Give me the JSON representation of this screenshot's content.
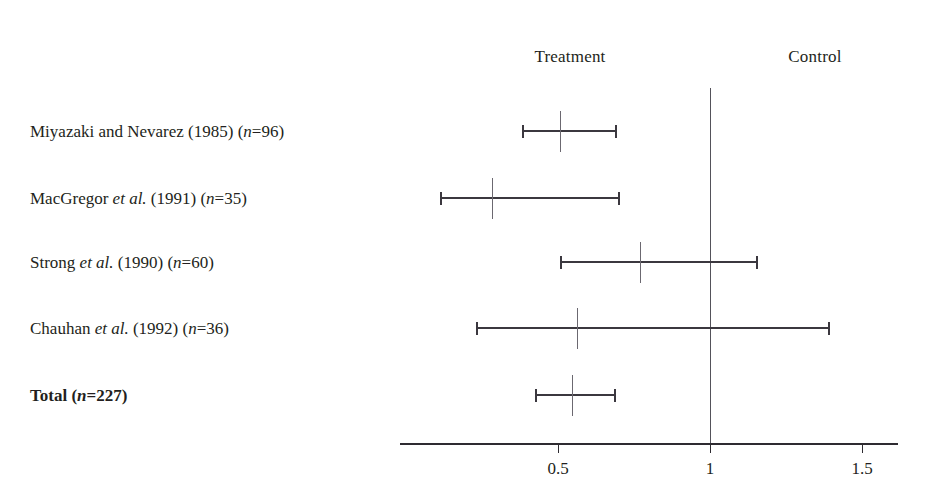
{
  "figure": {
    "type": "forest-plot",
    "width": 928,
    "height": 502,
    "background_color": "#ffffff",
    "line_color": "#3b383f",
    "text_color": "#231f20"
  },
  "headers": {
    "left": "Treatment",
    "right": "Control",
    "left_x": 570,
    "right_x": 815,
    "y": 47
  },
  "axis": {
    "y": 443,
    "x_start": 400,
    "x_end": 898,
    "ticks": [
      {
        "label": "0.5",
        "value": 0.5,
        "x": 558
      },
      {
        "label": "1",
        "value": 1,
        "x": 710
      },
      {
        "label": "1.5",
        "value": 1.5,
        "x": 862
      }
    ],
    "null_value": 1,
    "null_line_x": 710,
    "null_line_top": 88,
    "px_per_unit": 304,
    "x_at_zero": 406
  },
  "chart_data": {
    "type": "forest",
    "title": "",
    "xlabel": "",
    "ylabel": "",
    "xlim": [
      0.0,
      1.62
    ],
    "grid": false,
    "effect_measure": "odds ratio",
    "null_value": 1,
    "favors_left": "Treatment",
    "favors_right": "Control",
    "categories": [
      "Miyazaki and Nevarez (1985) (n=96)",
      "MacGregor et al. (1991) (n=35)",
      "Strong et al. (1990) (n=60)",
      "Chauhan et al. (1992) (n=36)",
      "Total (n=227)"
    ],
    "values": [
      0.51,
      0.28,
      0.77,
      0.56,
      0.55
    ],
    "ci_low": [
      0.38,
      0.11,
      0.51,
      0.23,
      0.42
    ],
    "ci_high": [
      0.69,
      0.7,
      1.16,
      1.39,
      0.69
    ],
    "rows": [
      {
        "id": "miyazaki-1985",
        "label_parts": [
          {
            "text": "Miyazaki and Nevarez (1985) (",
            "italic": false
          },
          {
            "text": "n",
            "italic": true
          },
          {
            "text": "=96)",
            "italic": false
          }
        ],
        "label_plain": "Miyazaki and Nevarez (1985) (n=96)",
        "author": "Miyazaki and Nevarez",
        "year": "1985",
        "n": 96,
        "estimate": 0.51,
        "ci_low": 0.38,
        "ci_high": 0.69,
        "y": 131,
        "bold": false,
        "x_estimate": 560,
        "x_low": 522,
        "x_high": 617
      },
      {
        "id": "macgregor-1991",
        "label_parts": [
          {
            "text": "MacGregor ",
            "italic": false
          },
          {
            "text": "et al.",
            "italic": true
          },
          {
            "text": " (1991) (",
            "italic": false
          },
          {
            "text": "n",
            "italic": true
          },
          {
            "text": "=35)",
            "italic": false
          }
        ],
        "label_plain": "MacGregor et al. (1991) (n=35)",
        "author": "MacGregor et al.",
        "year": "1991",
        "n": 35,
        "estimate": 0.28,
        "ci_low": 0.11,
        "ci_high": 0.7,
        "y": 198,
        "bold": false,
        "x_estimate": 492,
        "x_low": 440,
        "x_high": 620
      },
      {
        "id": "strong-1990",
        "label_parts": [
          {
            "text": "Strong ",
            "italic": false
          },
          {
            "text": "et al.",
            "italic": true
          },
          {
            "text": " (1990) (",
            "italic": false
          },
          {
            "text": "n",
            "italic": true
          },
          {
            "text": "=60)",
            "italic": false
          }
        ],
        "label_plain": "Strong et al. (1990) (n=60)",
        "author": "Strong et al.",
        "year": "1990",
        "n": 60,
        "estimate": 0.77,
        "ci_low": 0.51,
        "ci_high": 1.16,
        "y": 262,
        "bold": false,
        "x_estimate": 640,
        "x_low": 560,
        "x_high": 758
      },
      {
        "id": "chauhan-1992",
        "label_parts": [
          {
            "text": "Chauhan ",
            "italic": false
          },
          {
            "text": "et al.",
            "italic": true
          },
          {
            "text": " (1992) (",
            "italic": false
          },
          {
            "text": "n",
            "italic": true
          },
          {
            "text": "=36)",
            "italic": false
          }
        ],
        "label_plain": "Chauhan et al. (1992) (n=36)",
        "author": "Chauhan et al.",
        "year": "1992",
        "n": 36,
        "estimate": 0.56,
        "ci_low": 0.23,
        "ci_high": 1.39,
        "y": 328,
        "bold": false,
        "x_estimate": 577,
        "x_low": 476,
        "x_high": 830
      },
      {
        "id": "total",
        "label_parts": [
          {
            "text": "Total (",
            "italic": false
          },
          {
            "text": "n",
            "italic": true
          },
          {
            "text": "=227)",
            "italic": false
          }
        ],
        "label_plain": "Total (n=227)",
        "author": "Total",
        "year": "",
        "n": 227,
        "estimate": 0.55,
        "ci_low": 0.42,
        "ci_high": 0.69,
        "y": 395,
        "bold": true,
        "x_estimate": 572,
        "x_low": 535,
        "x_high": 616
      }
    ]
  }
}
